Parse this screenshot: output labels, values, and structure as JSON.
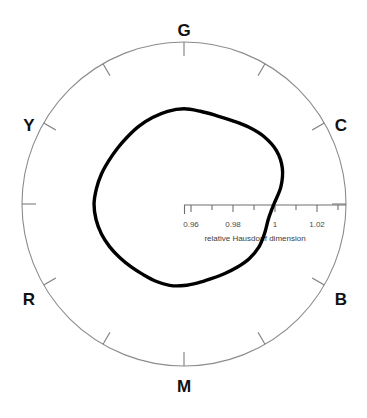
{
  "chart_data": {
    "type": "line",
    "subtype": "polar-closed-curve",
    "title": "",
    "xlabel": "relative Hausdorff dimension",
    "ylabel": "",
    "grid": false,
    "legend": null,
    "radial_axis": {
      "label": "relative Hausdorff dimension",
      "direction_deg": 0,
      "tick_labels": [
        "0.96",
        "0.98",
        "1",
        "1.02"
      ],
      "tick_values": [
        0.96,
        0.98,
        1.0,
        1.02
      ],
      "minor_ticks_per_interval": 1,
      "rlim": [
        0.948,
        0.0
      ],
      "r_at_center": 0.948,
      "r_at_edge": 1.032
    },
    "angular_axis": {
      "tick_interval_deg": 30,
      "labels": [
        "G",
        "C",
        "B",
        "M",
        "R",
        "Y"
      ],
      "label_angles_deg": [
        90,
        30,
        330,
        270,
        210,
        150
      ],
      "hue_names": [
        "Green",
        "Cyan",
        "Blue",
        "Magenta",
        "Red",
        "Yellow"
      ]
    },
    "angles_deg": [
      0,
      10,
      20,
      30,
      40,
      50,
      60,
      70,
      80,
      90,
      100,
      110,
      120,
      130,
      140,
      150,
      160,
      170,
      180,
      190,
      200,
      210,
      220,
      230,
      240,
      250,
      260,
      270,
      280,
      290,
      300,
      310,
      320,
      330,
      340,
      350
    ],
    "values": [
      0.9995,
      1.0035,
      1.0065,
      1.0075,
      1.0065,
      1.0045,
      1.0025,
      1.0015,
      1.0015,
      1.002,
      1.0015,
      1.0005,
      0.9995,
      0.9985,
      0.998,
      0.998,
      0.9985,
      0.999,
      0.9995,
      0.9992,
      0.9985,
      0.9975,
      0.9965,
      0.9958,
      0.9955,
      0.9958,
      0.996,
      0.9955,
      0.9948,
      0.9945,
      0.995,
      0.996,
      0.9972,
      0.9978,
      0.9975,
      0.9975
    ],
    "series": [
      {
        "name": "relative Hausdorff dimension vs hue",
        "values": [
          0.9995,
          1.0035,
          1.0065,
          1.0075,
          1.0065,
          1.0045,
          1.0025,
          1.0015,
          1.0015,
          1.002,
          1.0015,
          1.0005,
          0.9995,
          0.9985,
          0.998,
          0.998,
          0.9985,
          0.999,
          0.9995,
          0.9992,
          0.9985,
          0.9975,
          0.9965,
          0.9958,
          0.9955,
          0.9958,
          0.996,
          0.9955,
          0.9948,
          0.9945,
          0.995,
          0.996,
          0.9972,
          0.9978,
          0.9975,
          0.9975
        ],
        "color": "#000000",
        "line_width": 3
      }
    ]
  },
  "labels": {
    "g": "G",
    "c": "C",
    "b": "B",
    "m": "M",
    "r": "R",
    "y": "Y"
  },
  "axis": {
    "title": "relative Hausdorff dimension",
    "tick_0": "0.96",
    "tick_1": "0.98",
    "tick_2": "1",
    "tick_3": "1.02"
  },
  "colors": {
    "curve": "#000000",
    "circle": "#8c8c8c",
    "axis": "#6e6e6e",
    "text": "#111111",
    "tick_text": "#4a4a4a",
    "background": "#ffffff"
  }
}
